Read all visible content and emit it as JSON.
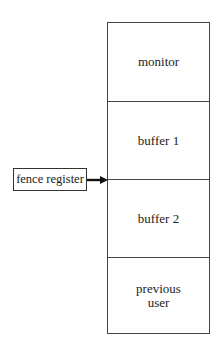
{
  "diagram": {
    "memory_segments": [
      {
        "label": "monitor"
      },
      {
        "label": "buffer 1"
      },
      {
        "label": "buffer 2"
      },
      {
        "label": "previous\nuser"
      }
    ],
    "pointer": {
      "label": "fence register",
      "points_to": "boundary between buffer 1 and buffer 2"
    }
  }
}
